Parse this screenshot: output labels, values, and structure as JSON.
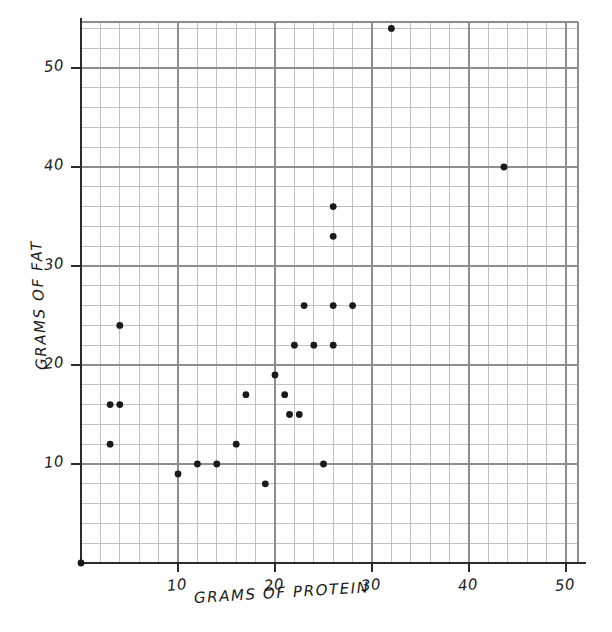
{
  "chart_data": {
    "type": "scatter",
    "title": "",
    "xlabel": "GRAMS OF PROTEIN",
    "ylabel": "GRAMS OF FAT",
    "xlim": [
      0,
      51
    ],
    "ylim": [
      0,
      56
    ],
    "grid": true,
    "grid_minor_step": 2,
    "grid_major_step": 10,
    "legend": "none",
    "marker": "filled-circle",
    "marker_color": "#1a1a1a",
    "xticks": [
      10,
      20,
      30,
      40,
      50
    ],
    "yticks": [
      10,
      20,
      30,
      40,
      50
    ],
    "xtick_labels": [
      "10",
      "20",
      "30",
      "40",
      "50"
    ],
    "ytick_labels": [
      "10",
      "20",
      "30",
      "40",
      "50"
    ],
    "points": [
      {
        "x": 0,
        "y": 0
      },
      {
        "x": 3,
        "y": 12
      },
      {
        "x": 3,
        "y": 16
      },
      {
        "x": 4,
        "y": 16
      },
      {
        "x": 4,
        "y": 24
      },
      {
        "x": 10,
        "y": 9
      },
      {
        "x": 12,
        "y": 10
      },
      {
        "x": 14,
        "y": 10
      },
      {
        "x": 16,
        "y": 12
      },
      {
        "x": 17,
        "y": 17
      },
      {
        "x": 19,
        "y": 8
      },
      {
        "x": 20,
        "y": 19
      },
      {
        "x": 21,
        "y": 17
      },
      {
        "x": 21.5,
        "y": 15
      },
      {
        "x": 22.5,
        "y": 15
      },
      {
        "x": 22,
        "y": 22
      },
      {
        "x": 23,
        "y": 26
      },
      {
        "x": 24,
        "y": 22
      },
      {
        "x": 25,
        "y": 10
      },
      {
        "x": 26,
        "y": 22
      },
      {
        "x": 26,
        "y": 26
      },
      {
        "x": 26,
        "y": 33
      },
      {
        "x": 26,
        "y": 36
      },
      {
        "x": 28,
        "y": 26
      },
      {
        "x": 32,
        "y": 54
      },
      {
        "x": 43.6,
        "y": 40
      }
    ],
    "n_points": 26
  },
  "axes": {
    "x_title": "GRAMS OF PROTEIN",
    "y_title": "GRAMS OF FAT",
    "x_tick_labels": [
      "10",
      "20",
      "30",
      "40",
      "50"
    ],
    "y_tick_labels": [
      "10",
      "20",
      "30",
      "40",
      "50"
    ]
  },
  "style": {
    "background": "#ffffff",
    "ink": "#1a1a1a",
    "grid_minor": "#b9b9b9",
    "grid_major": "#8d8d8d",
    "axis_line": "#2b2b2b"
  }
}
